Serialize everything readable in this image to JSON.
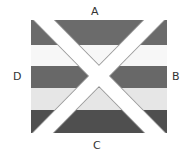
{
  "diagram": {
    "labels": {
      "top": "A",
      "right": "B",
      "bottom": "C",
      "left": "D"
    },
    "bands": [
      {
        "name": "band-1",
        "color": "#6b6b6b"
      },
      {
        "name": "band-2",
        "color": "#f7f7f7"
      },
      {
        "name": "band-3",
        "color": "#686868"
      },
      {
        "name": "band-4",
        "color": "#e6e6e6"
      },
      {
        "name": "band-5",
        "color": "#4f4f4f"
      }
    ],
    "cross_color": "#ffffff",
    "cross_outline": "#9a9a9a"
  }
}
